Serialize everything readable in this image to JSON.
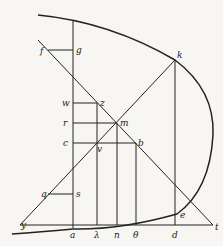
{
  "diagram": {
    "type": "geometric-figure",
    "labels": {
      "f": "f",
      "g": "g",
      "k": "k",
      "w": "w",
      "z": "z",
      "r": "r",
      "m": "m",
      "c": "c",
      "v": "v",
      "b": "b",
      "q": "q",
      "s": "s",
      "e": "e",
      "y": "y",
      "a": "a",
      "lambda": "λ",
      "n": "n",
      "theta": "θ",
      "d": "d",
      "t": "t"
    },
    "colors": {
      "stroke": "#222222",
      "background": "#f7f6f2"
    }
  }
}
